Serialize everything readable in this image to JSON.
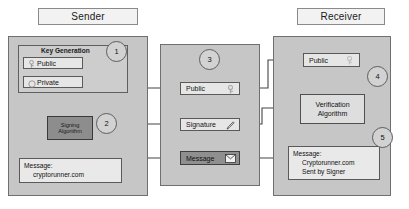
{
  "diagram": {
    "title_sender": "Sender",
    "title_receiver": "Receiver",
    "steps": [
      "1",
      "2",
      "3",
      "4",
      "5"
    ]
  },
  "sender": {
    "group_label": "Key Generation",
    "public_key": {
      "label": "Public",
      "icon": "key-icon"
    },
    "private_key": {
      "label": "Private",
      "icon": "key-round-icon"
    },
    "signing_algorithm": {
      "line1": "Signing",
      "line2": "Algorithm"
    },
    "message": {
      "label": "Message:",
      "value": "cryptorunner.com"
    }
  },
  "transit": {
    "public": {
      "label": "Public",
      "icon": "key-icon"
    },
    "signature": {
      "label": "Signature",
      "icon": "pen-icon"
    },
    "message": {
      "label": "Message",
      "icon": "envelope-icon"
    }
  },
  "receiver": {
    "public": {
      "label": "Public",
      "icon": "key-icon"
    },
    "verification_algorithm": {
      "line1": "Verification",
      "line2": "Algorithm"
    },
    "result": {
      "label": "Message:",
      "value_line1": "Cryptorunner.com",
      "value_line2": "Sent by Signer"
    }
  },
  "colors": {
    "panel_fill": "#c6c6c6",
    "node_fill": "#e6e6e6",
    "dark_node_fill": "#8f8f8f",
    "stroke": "#4a4a4a"
  }
}
